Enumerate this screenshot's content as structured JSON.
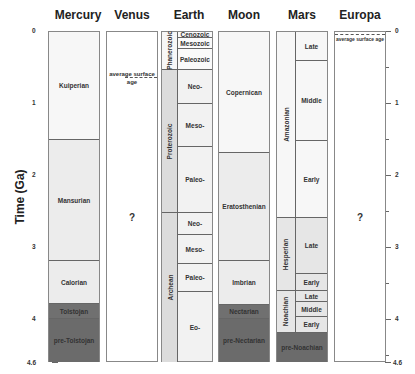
{
  "y_axis": {
    "label": "Time (Ga)",
    "ticks": [
      "0",
      "1",
      "2",
      "3",
      "4",
      "4.6"
    ]
  },
  "columns": {
    "mercury": {
      "title": "Mercury",
      "units": [
        "Kuiperian",
        "Mansurian",
        "Calorian",
        "Tolstojan",
        "pre-Tolstojan"
      ]
    },
    "venus": {
      "title": "Venus",
      "note": "average surface age",
      "unknown": "?"
    },
    "earth": {
      "title": "Earth",
      "eons": [
        "Phanerozoic",
        "Proterozoic",
        "Archean"
      ],
      "eras": [
        "Cenozoic",
        "Mesozoic",
        "Paleozoic",
        "Neo-",
        "Meso-",
        "Paleo-",
        "Neo-",
        "Meso-",
        "Paleo-",
        "Eo-"
      ]
    },
    "moon": {
      "title": "Moon",
      "units": [
        "Copernican",
        "Eratosthenian",
        "Imbrian",
        "Nectarian",
        "pre-Nectarian"
      ]
    },
    "mars": {
      "title": "Mars",
      "periods": [
        "Amazonian",
        "Hesperian",
        "Noachian"
      ],
      "epochs": [
        "Late",
        "Middle",
        "Early",
        "Late",
        "Early",
        "Late",
        "Middle",
        "Early"
      ],
      "pre": "pre-Noachian"
    },
    "europa": {
      "title": "Europa",
      "note": "average surface age",
      "unknown": "?"
    }
  },
  "colors": {
    "light": "#f2f2f2",
    "mid": "#dcdcdc",
    "dark": "#6b6b6b"
  }
}
